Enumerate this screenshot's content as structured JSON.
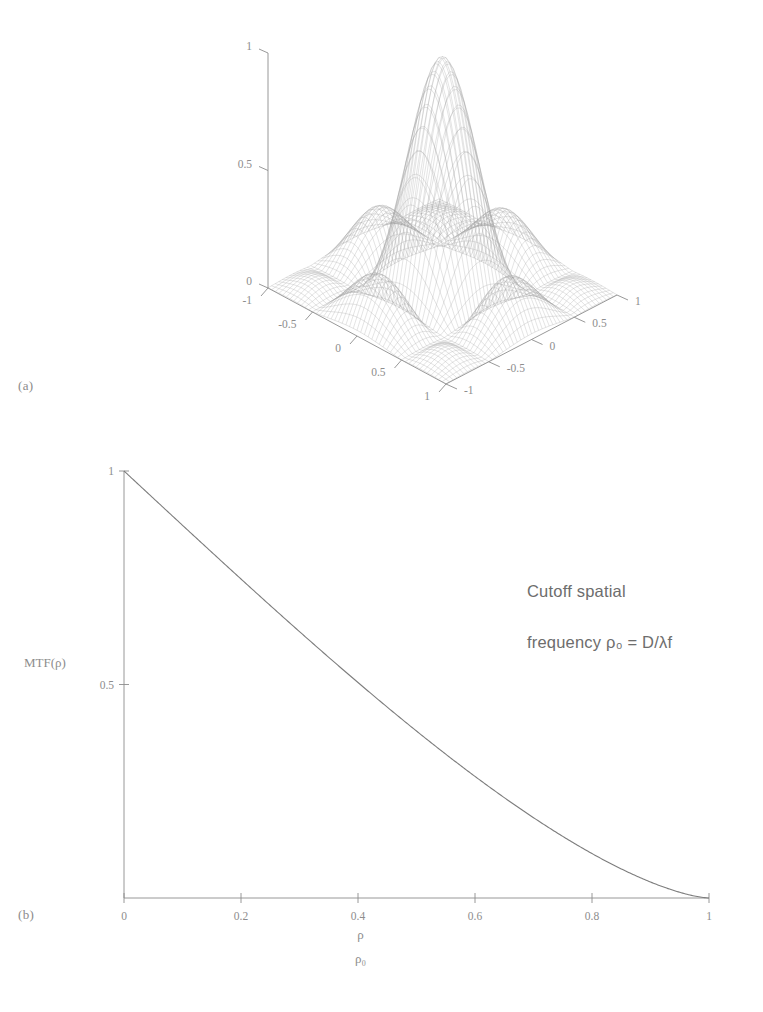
{
  "figure": {
    "panels": [
      {
        "id": "a",
        "label": "(a)",
        "kind": "surface3d"
      },
      {
        "id": "b",
        "label": "(b)",
        "kind": "line"
      }
    ]
  },
  "panel_a": {
    "label": "(a)",
    "z_axis": {
      "ticks": [
        "0",
        "0.5",
        "1"
      ],
      "values": [
        0,
        0.5,
        1
      ]
    },
    "x_axis": {
      "ticks": [
        "-1",
        "-0.5",
        "0",
        "0.5",
        "1"
      ],
      "values": [
        -1,
        -0.5,
        0,
        0.5,
        1
      ]
    },
    "y_axis": {
      "ticks": [
        "1",
        "0.5",
        "0",
        "-0.5",
        "-1"
      ],
      "values": [
        1,
        0.5,
        0,
        -0.5,
        -1
      ]
    }
  },
  "panel_b": {
    "label": "(b)",
    "ylabel": "MTF(ρ)",
    "xlabel_numerator": "ρ",
    "xlabel_denominator": "ρ₀",
    "annotation_line1": "Cutoff spatial",
    "annotation_line2": "frequency ρ₀ = D/λf",
    "y_ticks": [
      "0.5"
    ],
    "x_ticks": [
      "0",
      "0.2",
      "0.4",
      "0.6",
      "0.8",
      "1"
    ]
  },
  "chart_data": [
    {
      "type": "surface",
      "title": "",
      "xlabel": "",
      "ylabel": "",
      "zlabel": "",
      "xlim": [
        -1,
        1
      ],
      "ylim": [
        -1,
        1
      ],
      "zlim": [
        0,
        1
      ],
      "xticks": [
        -1,
        -0.5,
        0,
        0.5,
        1
      ],
      "yticks": [
        -1,
        -0.5,
        0,
        0.5,
        1
      ],
      "zticks": [
        0,
        0.5,
        1
      ],
      "grid": false,
      "legend": "none",
      "description": "Two-dimensional optical transfer function surface: a central peak of height 1 at the origin decaying to 0 at the edges, drawn as a fine wireframe mesh.",
      "function": "separable sinc-squared-like peak, z = |sinc(pi*x)*sinc(pi*y)| normalized to 1 at (0,0)",
      "mesh_n": 48
    },
    {
      "type": "line",
      "title": "",
      "xlabel": "rho / rho_0",
      "ylabel": "MTF(rho)",
      "xlim": [
        0,
        1
      ],
      "ylim": [
        0,
        1
      ],
      "xticks": [
        0,
        0.2,
        0.4,
        0.6,
        0.8,
        1
      ],
      "yticks": [
        0.5
      ],
      "grid": false,
      "legend": "none",
      "annotations": [
        "Cutoff spatial",
        "frequency ρ₀ = D/λf"
      ],
      "series": [
        {
          "name": "Diffraction-limited MTF",
          "formula": "(2/pi)*(acos(r) - r*sqrt(1-r^2))",
          "x": [
            0,
            0.05,
            0.1,
            0.15,
            0.2,
            0.25,
            0.3,
            0.35,
            0.4,
            0.45,
            0.5,
            0.55,
            0.6,
            0.65,
            0.7,
            0.75,
            0.8,
            0.85,
            0.9,
            0.95,
            1
          ],
          "values": [
            1.0,
            0.9363,
            0.8729,
            0.8101,
            0.7482,
            0.6875,
            0.6282,
            0.5706,
            0.515,
            0.4617,
            0.4106,
            0.3618,
            0.3153,
            0.2712,
            0.2295,
            0.1902,
            0.1535,
            0.1194,
            0.0881,
            0.0598,
            0.0
          ]
        }
      ]
    }
  ]
}
